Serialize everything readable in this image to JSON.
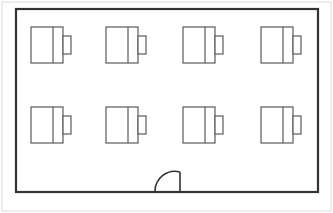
{
  "document": {
    "type": "architectural-floor-plan",
    "title": "Classroom Floor Plan",
    "background_color": "#ffffff",
    "line_color": "#3a3a3a",
    "furniture_line_color": "#555555",
    "frame_color": "#d8d8d8"
  },
  "frame": {
    "name": "image-border",
    "x": 2,
    "y": 2,
    "width": 329,
    "height": 209,
    "stroke": "#dcdcdc",
    "stroke_width": 1
  },
  "room": {
    "name": "room-outline",
    "label": "Room",
    "x": 16,
    "y": 9,
    "width": 302,
    "height": 183,
    "stroke": "#333333",
    "stroke_width": 2.2,
    "fill": "#ffffff"
  },
  "furniture": {
    "symbol": "desk-with-chair",
    "desk": {
      "width": 32,
      "height": 36,
      "divider_offset": 22
    },
    "chair": {
      "width": 8,
      "height": 18,
      "gap": 0
    },
    "stroke": "#5a5a5a",
    "stroke_width": 1.2,
    "rows": [
      {
        "name": "desk-row-top",
        "y": 27,
        "units": [
          {
            "name": "desk-unit-1",
            "x": 31,
            "seat_label": "1"
          },
          {
            "name": "desk-unit-2",
            "x": 106,
            "seat_label": "2"
          },
          {
            "name": "desk-unit-3",
            "x": 183,
            "seat_label": "3"
          },
          {
            "name": "desk-unit-4",
            "x": 261,
            "seat_label": "4"
          }
        ]
      },
      {
        "name": "desk-row-bottom",
        "y": 107,
        "units": [
          {
            "name": "desk-unit-5",
            "x": 31,
            "seat_label": "5"
          },
          {
            "name": "desk-unit-6",
            "x": 106,
            "seat_label": "6"
          },
          {
            "name": "desk-unit-7",
            "x": 183,
            "seat_label": "7"
          },
          {
            "name": "desk-unit-8",
            "x": 261,
            "seat_label": "8"
          }
        ]
      }
    ]
  },
  "door": {
    "name": "door-swing",
    "label": "Door",
    "wall": "bottom",
    "hinge_x": 180,
    "hinge_y": 192,
    "leaf_top_y": 172,
    "open_x": 155,
    "open_y": 192,
    "stroke": "#333333",
    "stroke_width": 1.6
  },
  "counts": {
    "desks": 8,
    "rows": 2,
    "columns": 4,
    "doors": 1
  }
}
